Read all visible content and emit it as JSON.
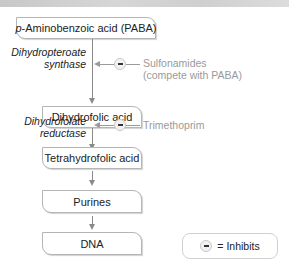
{
  "diagram": {
    "type": "metabolic-pathway",
    "steps": [
      {
        "id": "paba",
        "label": "p-Aminobenzoic acid (PABA)",
        "italic_prefix": "p",
        "rest": "-Aminobenzoic acid (PABA)"
      },
      {
        "id": "dihydrofolic",
        "label": "Dihydrofolic acid"
      },
      {
        "id": "tetrahydrofolic",
        "label": "Tetrahydrofolic acid"
      },
      {
        "id": "purines",
        "label": "Purines"
      },
      {
        "id": "dna",
        "label": "DNA"
      }
    ],
    "enzymes": [
      {
        "line1": "Dihydropteroate",
        "line2": "synthase"
      },
      {
        "line1": "Dihydrofolate",
        "line2": "reductase"
      }
    ],
    "inhibitors": [
      {
        "line1": "Sulfonamides",
        "line2": "(compete with PABA)"
      },
      {
        "line1": "Trimethoprim",
        "line2": ""
      }
    ],
    "legend": {
      "symbol": "inhibit-icon",
      "label": "= Inhibits"
    },
    "colors": {
      "arrow": "#8a8a8a",
      "inhibitor_text": "#9a9a9a",
      "box_border": "#b5b5b5"
    }
  }
}
